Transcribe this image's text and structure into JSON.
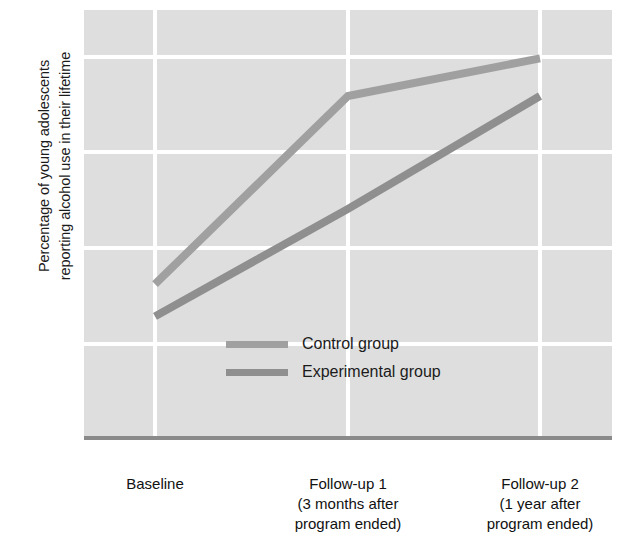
{
  "chart_data": {
    "type": "line",
    "title": "",
    "subtitle": "",
    "xlabel": "",
    "ylabel": "Percentage of young adolescents reporting alcohol use in their lifetime",
    "ylabel_lines": [
      "Percentage of young adolescents",
      "reporting alcohol use in their lifetime"
    ],
    "categories": [
      "Baseline",
      "Follow-up 1 (3 months after program ended)",
      "Follow-up 2 (1 year after program ended)"
    ],
    "category_lines": [
      [
        "Baseline"
      ],
      [
        "Follow-up 1",
        "(3 months after",
        "program ended)"
      ],
      [
        "Follow-up 2",
        "(1 year after",
        "program ended)"
      ]
    ],
    "series": [
      {
        "name": "Control group",
        "values": [
          64.5,
          82.0,
          85.5
        ],
        "color": "#a0a0a0"
      },
      {
        "name": "Experimental group",
        "values": [
          61.5,
          71.5,
          82.0
        ],
        "color": "#8f8f8f"
      }
    ],
    "ylim": [
      50,
      90
    ],
    "yticks": [
      90,
      80,
      70,
      60,
      50
    ],
    "ytick_labels": [
      "90",
      "80",
      "70",
      "60",
      "50"
    ],
    "grid": "on",
    "grid_color": "#ffffff",
    "plot_background": "#dedede",
    "axis_color": "#8a8a8a",
    "legend_position": "inside-center-lower"
  },
  "legend": {
    "entries": [
      {
        "label": "Control group",
        "color": "#a0a0a0"
      },
      {
        "label": "Experimental group",
        "color": "#8f8f8f"
      }
    ]
  }
}
